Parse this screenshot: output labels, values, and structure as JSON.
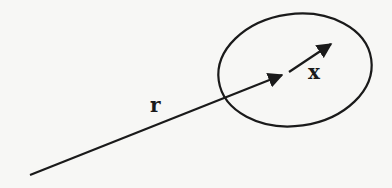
{
  "diagram": {
    "labels": {
      "r": "r",
      "x": "x"
    },
    "colors": {
      "background": "#f7f7f5",
      "stroke": "#1a1a1a"
    },
    "elements": {
      "region": {
        "shape": "ellipse",
        "cx": 295,
        "cy": 70,
        "rx": 77,
        "ry": 56,
        "rotate": -8
      },
      "vector_r": {
        "from": [
          30,
          175
        ],
        "to": [
          290,
          72
        ],
        "label_pos": [
          150,
          112
        ]
      },
      "vector_x": {
        "from": [
          290,
          72
        ],
        "to": [
          333,
          43
        ],
        "label_pos": [
          310,
          78
        ]
      }
    }
  }
}
